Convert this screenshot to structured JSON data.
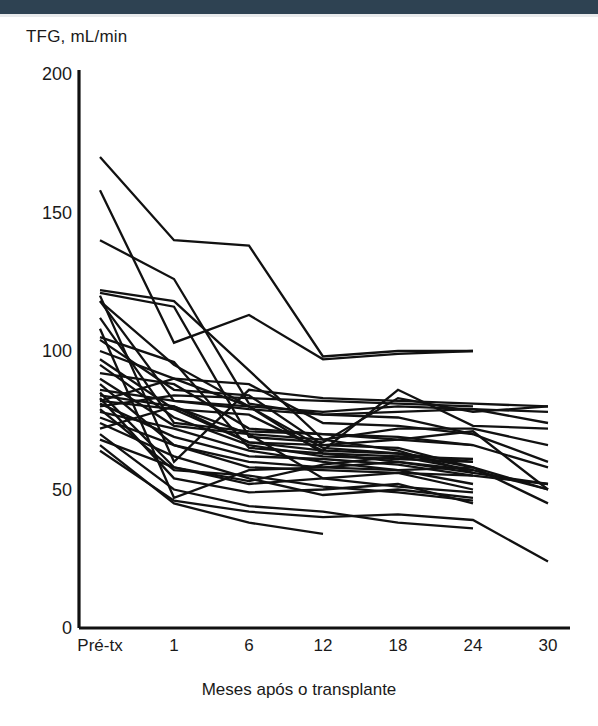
{
  "figure": {
    "top_band_color": "#2e4252",
    "background": "#ffffff",
    "line_color": "#111111"
  },
  "axes": {
    "ylabel": "TFG, mL/min",
    "xlabel": "Meses após o transplante",
    "yticks": [
      "0",
      "50",
      "100",
      "150",
      "200"
    ],
    "xticks": [
      "Pré-tx",
      "1",
      "6",
      "12",
      "18",
      "24",
      "30"
    ]
  },
  "chart_data": {
    "type": "line",
    "title": "",
    "subtitle": "",
    "xlabel": "Meses após o transplante",
    "ylabel": "TFG, mL/min",
    "categories": [
      "Pré-tx",
      "1",
      "6",
      "12",
      "18",
      "24",
      "30"
    ],
    "x": [
      0,
      1,
      6,
      12,
      18,
      24,
      30
    ],
    "ylim": [
      0,
      200
    ],
    "yticks": [
      0,
      50,
      100,
      150,
      200
    ],
    "grid": false,
    "legend": "none",
    "annotation": "Spaghetti plot: individual patient glomerular filtration rate (TFG) trajectories from pre-transplant through 30 months post-transplant; most trajectories decline sharply by month 1 and then drift slowly downward.",
    "series": [
      {
        "name": "p01",
        "values": [
          170,
          140,
          138,
          98,
          100,
          100,
          null
        ]
      },
      {
        "name": "p02",
        "values": [
          158,
          103,
          113,
          97,
          99,
          100,
          null
        ]
      },
      {
        "name": "p03",
        "values": [
          140,
          126,
          81,
          77,
          78,
          79,
          74
        ]
      },
      {
        "name": "p04",
        "values": [
          122,
          118,
          93,
          68,
          72,
          72,
          66
        ]
      },
      {
        "name": "p05",
        "values": [
          121,
          116,
          69,
          67,
          83,
          78,
          80
        ]
      },
      {
        "name": "p06",
        "values": [
          120,
          60,
          86,
          83,
          82,
          81,
          80
        ]
      },
      {
        "name": "p07",
        "values": [
          118,
          82,
          79,
          77,
          76,
          70,
          60
        ]
      },
      {
        "name": "p08",
        "values": [
          112,
          74,
          71,
          70,
          68,
          66,
          58
        ]
      },
      {
        "name": "p09",
        "values": [
          108,
          47,
          57,
          58,
          60,
          56,
          52
        ]
      },
      {
        "name": "p10",
        "values": [
          104,
          86,
          84,
          66,
          65,
          58,
          50
        ]
      },
      {
        "name": "p11",
        "values": [
          100,
          90,
          80,
          63,
          60,
          57,
          50
        ]
      },
      {
        "name": "p12",
        "values": [
          97,
          79,
          67,
          64,
          63,
          58,
          45
        ]
      },
      {
        "name": "p13",
        "values": [
          95,
          76,
          66,
          62,
          61,
          60,
          null
        ]
      },
      {
        "name": "p14",
        "values": [
          92,
          88,
          72,
          70,
          69,
          66,
          null
        ]
      },
      {
        "name": "p15",
        "values": [
          90,
          73,
          70,
          54,
          51,
          49,
          null
        ]
      },
      {
        "name": "p16",
        "values": [
          88,
          66,
          60,
          58,
          57,
          52,
          null
        ]
      },
      {
        "name": "p17",
        "values": [
          86,
          82,
          80,
          78,
          80,
          79,
          78
        ]
      },
      {
        "name": "p18",
        "values": [
          85,
          58,
          53,
          59,
          62,
          57,
          null
        ]
      },
      {
        "name": "p19",
        "values": [
          84,
          80,
          67,
          66,
          68,
          71,
          50
        ]
      },
      {
        "name": "p20",
        "values": [
          83,
          54,
          49,
          50,
          52,
          45,
          null
        ]
      },
      {
        "name": "p21",
        "values": [
          82,
          79,
          77,
          64,
          86,
          73,
          72
        ]
      },
      {
        "name": "p22",
        "values": [
          81,
          69,
          62,
          61,
          59,
          55,
          52
        ]
      },
      {
        "name": "p23",
        "values": [
          80,
          84,
          83,
          82,
          81,
          80,
          null
        ]
      },
      {
        "name": "p24",
        "values": [
          79,
          57,
          55,
          51,
          49,
          46,
          null
        ]
      },
      {
        "name": "p25",
        "values": [
          78,
          72,
          64,
          60,
          57,
          58,
          null
        ]
      },
      {
        "name": "p26",
        "values": [
          76,
          66,
          58,
          57,
          56,
          55,
          null
        ]
      },
      {
        "name": "p27",
        "values": [
          74,
          62,
          54,
          48,
          50,
          47,
          null
        ]
      },
      {
        "name": "p28",
        "values": [
          72,
          80,
          70,
          68,
          64,
          56,
          null
        ]
      },
      {
        "name": "p29",
        "values": [
          70,
          50,
          44,
          42,
          38,
          36,
          null
        ]
      },
      {
        "name": "p30",
        "values": [
          68,
          58,
          52,
          54,
          56,
          50,
          null
        ]
      },
      {
        "name": "p31",
        "values": [
          66,
          45,
          38,
          34,
          null,
          null,
          null
        ]
      },
      {
        "name": "p32",
        "values": [
          64,
          46,
          42,
          40,
          41,
          39,
          24
        ]
      },
      {
        "name": "p33",
        "values": [
          82,
          90,
          88,
          74,
          73,
          70,
          null
        ]
      },
      {
        "name": "p34",
        "values": [
          118,
          95,
          80,
          65,
          63,
          60,
          null
        ]
      },
      {
        "name": "p35",
        "values": [
          105,
          96,
          65,
          63,
          62,
          61,
          null
        ]
      }
    ]
  }
}
